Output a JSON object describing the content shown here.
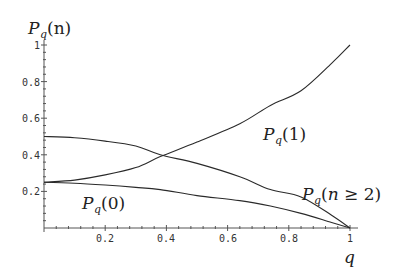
{
  "chart_data": {
    "type": "line",
    "title": "",
    "xlabel": "q",
    "ylabel": "P_q(n)",
    "xlim": [
      0,
      1
    ],
    "ylim": [
      0,
      1
    ],
    "grid": false,
    "legend": "inline labels",
    "x_ticks": [
      "0.2",
      "0.4",
      "0.6",
      "0.8",
      "1"
    ],
    "y_ticks": [
      "0.2",
      "0.4",
      "0.6",
      "0.8",
      "1"
    ],
    "x": [
      0,
      0.1,
      0.2,
      0.3,
      0.38,
      0.5,
      0.64,
      0.74,
      0.84,
      0.94,
      1.0
    ],
    "series": [
      {
        "name": "P_q(0)",
        "label": "Pq(0)",
        "values": [
          0.25,
          0.245,
          0.235,
          0.222,
          0.21,
          0.177,
          0.15,
          0.12,
          0.08,
          0.03,
          0.0
        ]
      },
      {
        "name": "P_q(1)",
        "label": "Pq(1)",
        "values": [
          0.25,
          0.262,
          0.29,
          0.33,
          0.39,
          0.47,
          0.57,
          0.67,
          0.75,
          0.9,
          1.0
        ]
      },
      {
        "name": "P_q(n>=2)",
        "label": "Pq(n ≥ 2)",
        "values": [
          0.5,
          0.493,
          0.475,
          0.448,
          0.4,
          0.353,
          0.28,
          0.21,
          0.17,
          0.07,
          0.0
        ]
      }
    ],
    "annotations": [
      {
        "text": "Pq(1)",
        "x": 0.72,
        "y": 0.5
      },
      {
        "text": "Pq(0)",
        "x": 0.1,
        "y": 0.12
      },
      {
        "text": "Pq(n ≥ 2)",
        "x": 0.82,
        "y": 0.14
      }
    ]
  },
  "labels": {
    "ylabel_main": "P",
    "ylabel_sub": "q",
    "ylabel_arg": "(n)",
    "xlabel": "q",
    "p1_main": "P",
    "p1_sub": "q",
    "p1_arg": "(1)",
    "p0_main": "P",
    "p0_sub": "q",
    "p0_arg": "(0)",
    "p2_main": "P",
    "p2_sub": "q",
    "p2_arg_open": "(",
    "p2_n": "n",
    "p2_rest": " ≥ 2)"
  }
}
